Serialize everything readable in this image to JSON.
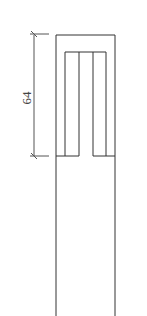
{
  "drawing": {
    "dimension": {
      "label": "64",
      "orientation": "vertical"
    },
    "stroke_color": "#333333",
    "dimension_color": "#555555"
  }
}
